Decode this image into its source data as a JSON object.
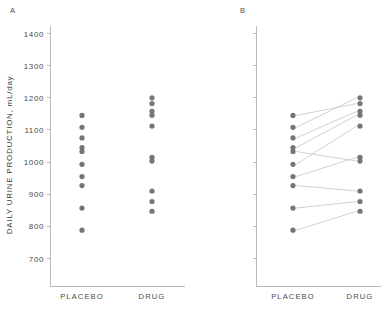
{
  "figure": {
    "panel_a_letter": "A",
    "panel_b_letter": "B",
    "y_axis_title": "DAILY URINE PRODUCTION, mL/day",
    "dot_color": "#757575",
    "line_color": "#c9c9c9",
    "axis_color": "#b9b9b9",
    "background_color": "#ffffff"
  },
  "chart_data": [
    {
      "type": "scatter",
      "panel": "A",
      "title": "A",
      "xlabel": "",
      "ylabel": "DAILY URINE PRODUCTION, mL/day",
      "ylim": [
        660,
        1400
      ],
      "yticks": [
        700,
        800,
        900,
        1000,
        1100,
        1200,
        1300,
        1400
      ],
      "ytick_labels": [
        "700",
        "800",
        "900",
        "1000",
        "1100",
        "1200",
        "1300",
        "1400"
      ],
      "grid": false,
      "legend": "none",
      "categories": [
        "PLACEBO",
        "DRUG"
      ],
      "series": [
        {
          "name": "PLACEBO",
          "values": [
            1145,
            1108,
            1075,
            1045,
            1033,
            993,
            955,
            927,
            857,
            788
          ]
        },
        {
          "name": "DRUG",
          "values": [
            1200,
            1182,
            1158,
            1146,
            1112,
            1015,
            1003,
            910,
            877,
            847
          ]
        }
      ],
      "annotation": "Unpaired dot plot of the same data shown in panel B"
    },
    {
      "type": "scatter",
      "panel": "B",
      "title": "B",
      "xlabel": "",
      "ylabel": "",
      "ylim": [
        660,
        1400
      ],
      "yticks": [
        700,
        800,
        900,
        1000,
        1100,
        1200,
        1300,
        1400
      ],
      "ytick_labels": [
        "",
        "",
        "",
        "",
        "",
        "",
        "",
        ""
      ],
      "grid": false,
      "legend": "none",
      "categories": [
        "PLACEBO",
        "DRUG"
      ],
      "series": [
        {
          "name": "PLACEBO",
          "values": [
            1145,
            1108,
            1075,
            1045,
            1033,
            993,
            955,
            927,
            857,
            788
          ]
        },
        {
          "name": "DRUG",
          "values": [
            1200,
            1182,
            1158,
            1146,
            1112,
            1015,
            1003,
            910,
            877,
            847
          ]
        }
      ],
      "paired_observations": [
        {
          "subject": 1,
          "placebo": 1145,
          "drug": 1182
        },
        {
          "subject": 2,
          "placebo": 1108,
          "drug": 1200
        },
        {
          "subject": 3,
          "placebo": 1075,
          "drug": 1158
        },
        {
          "subject": 4,
          "placebo": 1045,
          "drug": 1146
        },
        {
          "subject": 5,
          "placebo": 1033,
          "drug": 1003
        },
        {
          "subject": 6,
          "placebo": 993,
          "drug": 1112
        },
        {
          "subject": 7,
          "placebo": 955,
          "drug": 1015
        },
        {
          "subject": 8,
          "placebo": 927,
          "drug": 910
        },
        {
          "subject": 9,
          "placebo": 857,
          "drug": 877
        },
        {
          "subject": 10,
          "placebo": 788,
          "drug": 847
        }
      ],
      "annotation": "Paired dot plot; lines connect before/after measurements for each subject"
    }
  ]
}
